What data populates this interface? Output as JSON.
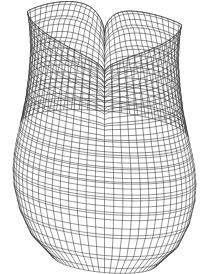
{
  "figure": {
    "title": "Wireframe surface plot of a vase-like surface",
    "type": "3d-wireframe-surface",
    "width": 208,
    "height": 274,
    "background_color": "#ffffff",
    "line_color": "#2b2b2b",
    "line_width": 0.55
  },
  "chart_data": {
    "type": "line",
    "title": "Wireframe surface plot of a vase-like surface",
    "xlabel": "",
    "ylabel": "",
    "grid": false,
    "legend": null,
    "render": {
      "projection": "orthographic",
      "elevation_deg": 14,
      "azimuth_deg": 0,
      "u_lines": 62,
      "v_lines": 46,
      "u_samples": 150,
      "v_samples": 150,
      "hidden_line_removal": true
    },
    "geometry": {
      "surface_kind": "surface-of-revolution-with-cusped-rim",
      "center_x": 104.5,
      "top_y": 12,
      "bottom_y": 264,
      "left_x": 13,
      "right_x": 196,
      "max_half_width": 91.5,
      "max_half_width_y": 192,
      "waist_half_width": 74,
      "waist_y": 96,
      "rim_dip_y": 56,
      "bottom_flatten": 0.86,
      "profile_v": [
        0.0,
        0.08,
        0.16,
        0.24,
        0.32,
        0.4,
        0.48,
        0.56,
        0.64,
        0.72,
        0.8,
        0.88,
        0.94,
        1.0
      ],
      "profile_half_width": [
        77,
        75,
        74,
        75.5,
        78,
        81.5,
        85,
        88,
        90.3,
        91.5,
        90.5,
        85,
        74,
        52
      ],
      "profile_y": [
        56,
        69,
        82,
        95,
        108,
        121,
        134,
        147,
        160,
        175,
        192,
        215,
        238,
        260
      ]
    },
    "rim": {
      "description": "Upper boundary curve of the surface; two cusped spikes with a cosine-like dip between them",
      "left_cusp": {
        "x": 29,
        "y": 12
      },
      "right_cusp": {
        "x": 179,
        "y": 45
      },
      "dip_center": {
        "x": 104,
        "y": 57
      },
      "dip_depth_px": 45,
      "tilt_deg": 12
    },
    "fold": {
      "description": "Interior crease where the far rim is seen through the mouth of the vase",
      "x": 104,
      "y_top": 60,
      "y_bottom": 140,
      "half_width_top": 30,
      "half_width_bottom": 6
    },
    "series": [
      {
        "name": "meridian-lines",
        "orientation": "vertical",
        "count": 62,
        "description": "Lines of constant angle running from rim to base"
      },
      {
        "name": "parallel-lines",
        "orientation": "horizontal",
        "count": 46,
        "description": "Lines of constant height running around the body"
      }
    ]
  }
}
